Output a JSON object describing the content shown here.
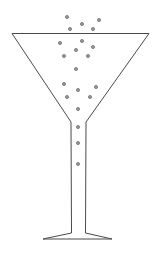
{
  "illustration": {
    "subject": "cocktail-glass-with-bubbles",
    "colors": {
      "outline": "#4a4a4a",
      "bubble_fill": "#9a9a9a",
      "bubble_stroke": "#555555",
      "background": "#ffffff"
    },
    "bubble_count": 19
  }
}
